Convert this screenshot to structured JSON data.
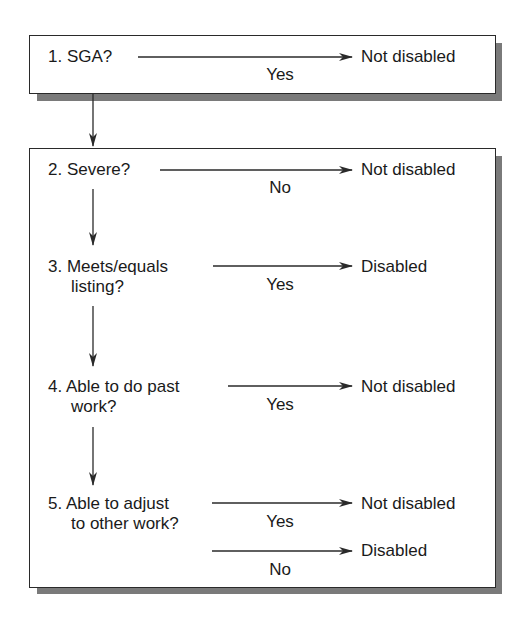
{
  "diagram": {
    "type": "flowchart",
    "boxes": [
      {
        "id": "box-1",
        "steps": [
          {
            "question": "1. SGA?",
            "question_line2": "",
            "branches": [
              {
                "condition": "Yes",
                "outcome": "Not disabled"
              }
            ]
          }
        ]
      },
      {
        "id": "box-2",
        "steps": [
          {
            "question": "2. Severe?",
            "question_line2": "",
            "branches": [
              {
                "condition": "No",
                "outcome": "Not disabled"
              }
            ]
          },
          {
            "question": "3. Meets/equals",
            "question_line2": "listing?",
            "branches": [
              {
                "condition": "Yes",
                "outcome": "Disabled"
              }
            ]
          },
          {
            "question": "4. Able to do past",
            "question_line2": "work?",
            "branches": [
              {
                "condition": "Yes",
                "outcome": "Not disabled"
              }
            ]
          },
          {
            "question": "5. Able to adjust",
            "question_line2": "to other work?",
            "branches": [
              {
                "condition": "Yes",
                "outcome": "Not disabled"
              },
              {
                "condition": "No",
                "outcome": "Disabled"
              }
            ]
          }
        ]
      }
    ],
    "colors": {
      "line": "#2a2a2a",
      "shadow": "#7a7a7a",
      "background": "#ffffff"
    }
  }
}
